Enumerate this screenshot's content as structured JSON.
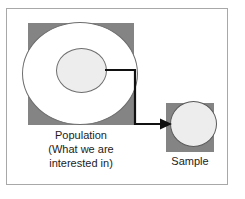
{
  "figure": {
    "type": "diagram",
    "background_color": "#ffffff",
    "frame_border_color": "#a8a8a8"
  },
  "colors": {
    "square_fill": "#848484",
    "outer_circle_fill": "#ffffff",
    "inner_circle_fill": "#ededed",
    "sample_circle_fill": "#ededed",
    "outline": "#6e6e6e",
    "connector": "#111111",
    "text": "#1c1c1c"
  },
  "population": {
    "label_lines": [
      "Population",
      "(What we are",
      "interested in)"
    ],
    "outer_shape_name": "population-outer-circle",
    "inner_shape_name": "population-inner-circle",
    "backdrop_shape_name": "population-square"
  },
  "sample": {
    "label": "Sample",
    "shape_name": "sample-circle",
    "backdrop_shape_name": "sample-square"
  },
  "connector": {
    "name": "sampling-arrow",
    "direction": "from population inner circle to sample circle",
    "style": "elbow with arrowhead"
  }
}
